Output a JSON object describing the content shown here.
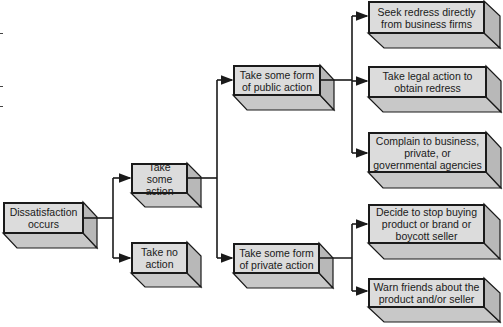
{
  "diagram": {
    "type": "flowchart",
    "nodes": {
      "dissatisfaction": "Dissatisfaction occurs",
      "take_action": "Take some action",
      "no_action": "Take no action",
      "public_action": "Take some form of public action",
      "private_action": "Take some form of private action",
      "seek_redress": "Seek redress directly from business firms",
      "legal_action": "Take legal action to obtain redress",
      "complain": "Complain to business, private, or governmental agencies",
      "stop_buying": "Decide to stop buying product or brand or boycott seller",
      "warn_friends": "Warn friends about the product and/or seller"
    },
    "edges": [
      [
        "dissatisfaction",
        "take_action"
      ],
      [
        "dissatisfaction",
        "no_action"
      ],
      [
        "take_action",
        "public_action"
      ],
      [
        "take_action",
        "private_action"
      ],
      [
        "public_action",
        "seek_redress"
      ],
      [
        "public_action",
        "legal_action"
      ],
      [
        "public_action",
        "complain"
      ],
      [
        "private_action",
        "stop_buying"
      ],
      [
        "private_action",
        "warn_friends"
      ]
    ],
    "colors": {
      "box_front": "#dcdcdc",
      "box_side": "#bdbdbd",
      "box_bottom": "#c8c8c8",
      "line": "#1a1a1a"
    }
  }
}
